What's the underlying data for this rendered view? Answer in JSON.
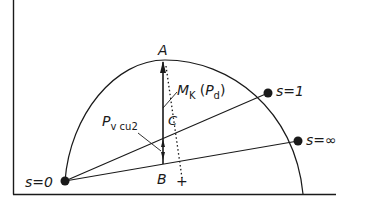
{
  "diagram": {
    "type": "circle-diagram",
    "colors": {
      "ink": "#1a1a1a",
      "background": "#ffffff"
    },
    "points": {
      "s0": {
        "label": "s=0"
      },
      "s1": {
        "label": "s=1"
      },
      "sinf": {
        "label": "s=∞"
      },
      "A": {
        "label": "A"
      },
      "B": {
        "label": "B"
      },
      "C": {
        "label": "C"
      },
      "center_mark": {
        "label": "+"
      }
    },
    "annotations": {
      "mk": {
        "main": "M",
        "sub1": "K",
        "paren_open": "(",
        "p": "P",
        "sub2": "d",
        "paren_close": ")"
      },
      "pv": {
        "main": "P",
        "sub": "v cu2"
      }
    }
  }
}
